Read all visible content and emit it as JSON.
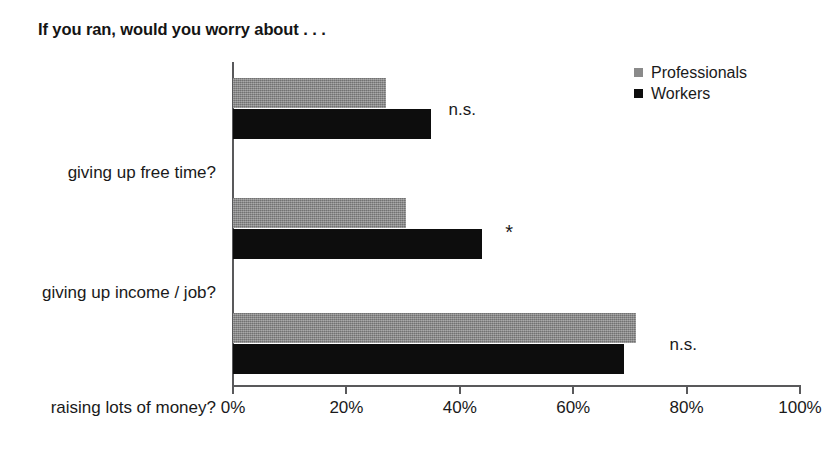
{
  "chart_data": {
    "type": "bar",
    "orientation": "horizontal",
    "title": "If you ran, would you worry about . . .",
    "xlabel": "",
    "ylabel": "",
    "xlim": [
      0,
      100
    ],
    "xticks": [
      0,
      20,
      40,
      60,
      80,
      100
    ],
    "xtick_labels": [
      "0%",
      "20%",
      "40%",
      "60%",
      "80%",
      "100%"
    ],
    "grid": false,
    "legend_position": "top-right",
    "categories": [
      "giving up free time?",
      "giving up income / job?",
      "raising lots of money?"
    ],
    "series": [
      {
        "name": "Professionals",
        "color": "#8a8a8a",
        "values": [
          27,
          30.5,
          71
        ]
      },
      {
        "name": "Workers",
        "color": "#0d0d0d",
        "values": [
          35,
          44,
          69
        ]
      }
    ],
    "annotations": [
      {
        "label": "n.s.",
        "category": "giving up free time?",
        "x": 38
      },
      {
        "label": "*",
        "category": "giving up income / job?",
        "x": 48
      },
      {
        "label": "n.s.",
        "category": "raising lots of money?",
        "x": 77
      }
    ]
  },
  "legend": {
    "items": [
      {
        "label": "Professionals",
        "color": "#8a8a8a"
      },
      {
        "label": "Workers",
        "color": "#0d0d0d"
      }
    ]
  },
  "axis": {
    "tick_labels": [
      "0%",
      "20%",
      "40%",
      "60%",
      "80%",
      "100%"
    ]
  }
}
